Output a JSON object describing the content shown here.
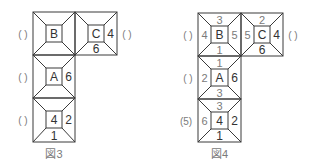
{
  "figures": [
    {
      "caption": "図3",
      "cells": [
        {
          "id": "B",
          "center": "B",
          "top": "",
          "right": "",
          "bottom": "",
          "left": ""
        },
        {
          "id": "C",
          "center": "C",
          "top": "",
          "right": "4",
          "bottom": "6",
          "left": ""
        },
        {
          "id": "A",
          "center": "A",
          "top": "",
          "right": "6",
          "bottom": "",
          "left": ""
        },
        {
          "id": "D",
          "center": "4",
          "top": "",
          "right": "2",
          "bottom": "1",
          "left": ""
        }
      ],
      "brackets": [
        "( )",
        "( )",
        "( )",
        "( )"
      ]
    },
    {
      "caption": "図4",
      "cells": [
        {
          "id": "B",
          "center": "B",
          "top": "3",
          "right": "5",
          "bottom": "1",
          "left": "4"
        },
        {
          "id": "C",
          "center": "C",
          "top": "2",
          "right": "4",
          "bottom": "6",
          "left": "5"
        },
        {
          "id": "A",
          "center": "A",
          "top": "1",
          "right": "6",
          "bottom": "3",
          "left": "2"
        },
        {
          "id": "D",
          "center": "4",
          "top": "3",
          "right": "2",
          "bottom": "1",
          "left": "6"
        }
      ],
      "brackets": [
        "( )",
        "( )",
        "( )",
        "(5)"
      ]
    }
  ]
}
